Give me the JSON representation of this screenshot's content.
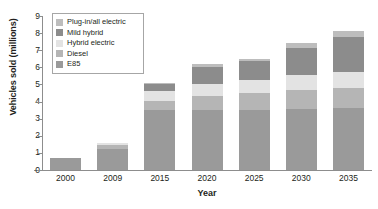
{
  "chart_data": {
    "type": "bar",
    "stacked": true,
    "title": "",
    "xlabel": "Year",
    "ylabel": "Vehicles sold (millions)",
    "categories": [
      "2000",
      "2009",
      "2015",
      "2020",
      "2025",
      "2030",
      "2035"
    ],
    "ylim": [
      0,
      9
    ],
    "yticks": [
      "0",
      "1",
      "2",
      "3",
      "4",
      "5",
      "6",
      "7",
      "8",
      "9"
    ],
    "grid": false,
    "legend_position": "top-left",
    "series": [
      {
        "name": "E85",
        "color": "#9a9a9a",
        "values": [
          0.7,
          1.25,
          3.5,
          3.5,
          3.5,
          3.55,
          3.6
        ]
      },
      {
        "name": "Diesel",
        "color": "#b5b5b5",
        "values": [
          0,
          0.2,
          0.55,
          0.85,
          1.0,
          1.1,
          1.2
        ]
      },
      {
        "name": "Hybrid electric",
        "color": "#e3e3e3",
        "values": [
          0,
          0.15,
          0.55,
          0.7,
          0.75,
          0.9,
          0.95
        ]
      },
      {
        "name": "Mild hybrid",
        "color": "#8c8c8c",
        "values": [
          0,
          0,
          0.4,
          1.0,
          1.15,
          1.6,
          2.0
        ]
      },
      {
        "name": "Plug-in/all electric",
        "color": "#bdbdbd",
        "values": [
          0,
          0,
          0.1,
          0.15,
          0.1,
          0.3,
          0.35
        ]
      }
    ],
    "totals": [
      0.7,
      1.6,
      5.1,
      6.2,
      6.5,
      7.45,
      8.1
    ],
    "legend": [
      {
        "label": "Plug-in/all electric",
        "color": "#bdbdbd"
      },
      {
        "label": "Mild hybrid",
        "color": "#8c8c8c"
      },
      {
        "label": "Hybrid electric",
        "color": "#e3e3e3"
      },
      {
        "label": "Diesel",
        "color": "#b5b5b5"
      },
      {
        "label": "E85",
        "color": "#9a9a9a"
      }
    ],
    "axis_color": "#8d8d8d"
  }
}
